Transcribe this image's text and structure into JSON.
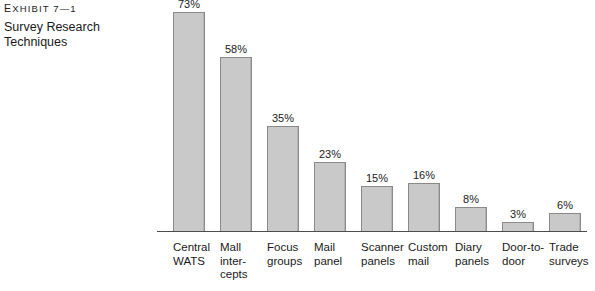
{
  "exhibit": {
    "label_prefix": "E",
    "label": "xhibit 7—1",
    "title": "Survey Research\nTechniques"
  },
  "chart_data": {
    "type": "bar",
    "title": "Survey Research Techniques",
    "xlabel": "",
    "ylabel": "",
    "ylim": [
      0,
      73
    ],
    "grid": false,
    "legend": "none",
    "value_suffix": "%",
    "categories": [
      "Central\nWATS",
      "Mall\ninter-\ncepts",
      "Focus\ngroups",
      "Mail\npanel",
      "Scanner\npanels",
      "Custom\nmail",
      "Diary\npanels",
      "Door-to-\ndoor",
      "Trade\nsurveys"
    ],
    "values": [
      73,
      58,
      35,
      23,
      15,
      16,
      8,
      3,
      6
    ],
    "value_labels": [
      "73%",
      "58%",
      "35%",
      "23%",
      "15%",
      "16%",
      "8%",
      "3%",
      "6%"
    ],
    "colors": {
      "bar_fill": "#c9c9c9",
      "bar_border": "#8a8a8a",
      "axis": "#4d4d4d",
      "text": "#1a1a1a",
      "background": "#ffffff"
    }
  }
}
